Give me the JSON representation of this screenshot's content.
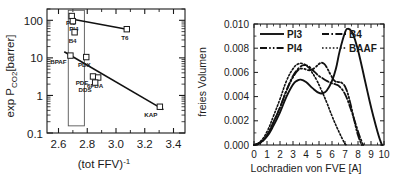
{
  "figure": {
    "panels": [
      "permeability-ffv-plot",
      "free-volume-distribution-plot"
    ]
  },
  "chart_data": [
    {
      "type": "scatter",
      "id": "permeability-vs-ffv",
      "title": "",
      "xlabel": "(tot FFV)",
      "xlabel_exponent": "-1",
      "ylabel_main": "exp P",
      "ylabel_sub": "CO2",
      "ylabel_unit": "[barrer]",
      "ylabel": "exp P CO2 [barrer]",
      "xlim": [
        2.52,
        3.48
      ],
      "ylim": [
        0.1,
        200
      ],
      "yscale": "log",
      "xticks": [
        2.6,
        2.8,
        3.0,
        3.2,
        3.4
      ],
      "xtick_labels": [
        "2.6",
        "2.8",
        "3.0",
        "3.2",
        "3.4"
      ],
      "yticks": [
        0.1,
        1,
        10,
        100
      ],
      "ytick_labels": [
        "0.1",
        "1",
        "10",
        "100"
      ],
      "grid": false,
      "points": [
        {
          "label": "PI3",
          "x": 2.692,
          "y": 130.0,
          "label_dx": -1,
          "label_dy": 9
        },
        {
          "label": "PI4",
          "x": 2.7,
          "y": 95.0,
          "label_dx": 1,
          "label_dy": 10
        },
        {
          "label": "B4",
          "x": 2.712,
          "y": 48.0,
          "label_dx": -2,
          "label_dy": 11
        },
        {
          "label": "T6",
          "x": 3.075,
          "y": 58.0,
          "label_dx": -2,
          "label_dy": 11
        },
        {
          "label": "BPAF",
          "x": 2.683,
          "y": 11.5,
          "label_dx": -12,
          "label_dy": 8
        },
        {
          "label": "PDX",
          "x": 2.793,
          "y": 10.5,
          "label_dx": -2,
          "label_dy": 10
        },
        {
          "label": "PDE",
          "x": 2.84,
          "y": 3.2,
          "label_dx": -11,
          "label_dy": 9
        },
        {
          "label": "6FDA",
          "x": 2.876,
          "y": 3.0,
          "label_dx": -3,
          "label_dy": 10
        },
        {
          "label": "DDS",
          "x": 2.855,
          "y": 2.2,
          "label_dx": -10,
          "label_dy": 9
        },
        {
          "label": "KAP",
          "x": 3.305,
          "y": 0.5,
          "label_dx": -9,
          "label_dy": 10
        }
      ],
      "trendlines": [
        {
          "name": "upper-trendline",
          "x1": 2.69,
          "y1": 108.0,
          "x2": 3.075,
          "y2": 58.0,
          "arrow": false
        },
        {
          "name": "lower-trendline",
          "x1": 2.64,
          "y1": 14.5,
          "x2": 3.33,
          "y2": 0.42,
          "arrow": true
        }
      ],
      "highlight_box": {
        "x1": 2.668,
        "x2": 2.78,
        "y1": 0.155,
        "y2": 185.0
      }
    },
    {
      "type": "line",
      "id": "free-volume-distribution",
      "title": "",
      "xlabel": "Lochradien von FVE [A]",
      "ylabel": "freies Volumen",
      "xlim": [
        0,
        10
      ],
      "ylim": [
        0.0,
        0.01
      ],
      "xticks": [
        0,
        1,
        2,
        3,
        4,
        5,
        6,
        7,
        8,
        9,
        10
      ],
      "xtick_labels": [
        "0",
        "1",
        "2",
        "3",
        "4",
        "5",
        "6",
        "7",
        "8",
        "9",
        "10"
      ],
      "yticks": [
        0.0,
        0.002,
        0.004,
        0.006,
        0.008,
        0.01
      ],
      "ytick_labels": [
        "0.000",
        "0.002",
        "0.004",
        "0.006",
        "0.008",
        "0.010"
      ],
      "grid": false,
      "legend_position": "top-left",
      "series": [
        {
          "name": "PI3",
          "style": "solid",
          "x": [
            0,
            0.5,
            1,
            1.5,
            2,
            2.5,
            3,
            3.3,
            3.6,
            4,
            4.5,
            5,
            5.3,
            5.6,
            6,
            6.3,
            6.6,
            7,
            7.2,
            7.5,
            7.8,
            8.1,
            8.5,
            8.9,
            9.2,
            9.5,
            9.7,
            9.85
          ],
          "values": [
            0.0,
            0.0002,
            0.0007,
            0.0016,
            0.0027,
            0.004,
            0.005,
            0.0053,
            0.0054,
            0.0052,
            0.0047,
            0.0043,
            0.0043,
            0.0045,
            0.0053,
            0.0063,
            0.0078,
            0.0093,
            0.0096,
            0.0094,
            0.0086,
            0.0074,
            0.0055,
            0.0036,
            0.0023,
            0.0011,
            0.0004,
            0.0
          ]
        },
        {
          "name": "B4",
          "style": "dashdot",
          "x": [
            0,
            0.5,
            1,
            1.5,
            2,
            2.5,
            3,
            3.5,
            3.9,
            4.2,
            4.5,
            4.8,
            5,
            5.3,
            5.6,
            6,
            6.3,
            6.6,
            7,
            7.4,
            7.8,
            8.1,
            8.4
          ],
          "values": [
            0.0,
            0.0002,
            0.0008,
            0.0019,
            0.0031,
            0.0045,
            0.0057,
            0.0064,
            0.0066,
            0.0065,
            0.0062,
            0.0059,
            0.0057,
            0.0055,
            0.0053,
            0.0051,
            0.005,
            0.0048,
            0.0042,
            0.0031,
            0.0018,
            0.0008,
            0.0
          ]
        },
        {
          "name": "PI4",
          "style": "dashdotdot",
          "x": [
            0,
            0.5,
            1,
            1.5,
            2,
            2.5,
            3,
            3.4,
            3.8,
            4.1,
            4.4,
            4.7,
            5,
            5.2,
            5.4,
            5.6,
            5.9,
            6.2,
            6.5,
            6.8,
            7.1,
            7.4,
            7.7,
            8.0,
            8.3
          ],
          "values": [
            0.0,
            0.0002,
            0.0008,
            0.0019,
            0.0031,
            0.0045,
            0.0056,
            0.0062,
            0.0063,
            0.0062,
            0.0062,
            0.0064,
            0.0067,
            0.0068,
            0.0067,
            0.0064,
            0.0058,
            0.0053,
            0.0052,
            0.0051,
            0.0046,
            0.0035,
            0.0021,
            0.0008,
            0.0
          ]
        },
        {
          "name": "BAAF",
          "style": "dotted",
          "x": [
            0,
            0.5,
            1,
            1.5,
            2,
            2.5,
            3,
            3.4,
            3.8,
            4.1,
            4.4,
            4.8,
            5.2,
            5.6,
            6,
            6.4,
            6.8,
            7.0,
            7.15
          ],
          "values": [
            0.0,
            0.0003,
            0.0011,
            0.0024,
            0.0038,
            0.0053,
            0.0063,
            0.0067,
            0.0067,
            0.0065,
            0.0061,
            0.0054,
            0.0045,
            0.0035,
            0.0024,
            0.0014,
            0.0005,
            0.0001,
            0.0
          ]
        }
      ]
    }
  ]
}
